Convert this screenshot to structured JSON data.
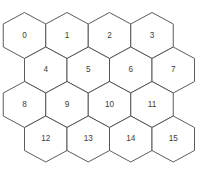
{
  "figure": {
    "name": "hexagonal-grid-diagram",
    "type": "hex-grid",
    "background_color": "#ffffff",
    "stroke_color": "#4a4a4a",
    "label_color": "#3b3b3b",
    "rows": 4,
    "columns": 4,
    "cell_count": 16,
    "orientation": "pointy-top",
    "hex_width": 42.5,
    "hex_height": 46.0,
    "row_step": 34.5,
    "row_offsets": [
      0,
      21.25,
      0,
      21.25
    ]
  },
  "cells": [
    {
      "label": "0",
      "row": 0,
      "col": 0,
      "cx": 24.5,
      "cy": 35.5
    },
    {
      "label": "1",
      "row": 0,
      "col": 1,
      "cx": 67.0,
      "cy": 35.5
    },
    {
      "label": "2",
      "row": 0,
      "col": 2,
      "cx": 109.5,
      "cy": 35.5
    },
    {
      "label": "3",
      "row": 0,
      "col": 3,
      "cx": 152.0,
      "cy": 35.5
    },
    {
      "label": "4",
      "row": 1,
      "col": 0,
      "cx": 45.75,
      "cy": 70.0
    },
    {
      "label": "5",
      "row": 1,
      "col": 1,
      "cx": 88.25,
      "cy": 70.0
    },
    {
      "label": "6",
      "row": 1,
      "col": 2,
      "cx": 130.75,
      "cy": 70.0
    },
    {
      "label": "7",
      "row": 1,
      "col": 3,
      "cx": 173.25,
      "cy": 70.0
    },
    {
      "label": "8",
      "row": 2,
      "col": 0,
      "cx": 24.5,
      "cy": 104.5
    },
    {
      "label": "9",
      "row": 2,
      "col": 1,
      "cx": 67.0,
      "cy": 104.5
    },
    {
      "label": "10",
      "row": 2,
      "col": 2,
      "cx": 109.5,
      "cy": 104.5
    },
    {
      "label": "11",
      "row": 2,
      "col": 3,
      "cx": 152.0,
      "cy": 104.5
    },
    {
      "label": "12",
      "row": 3,
      "col": 0,
      "cx": 45.75,
      "cy": 139.0
    },
    {
      "label": "13",
      "row": 3,
      "col": 1,
      "cx": 88.25,
      "cy": 139.0
    },
    {
      "label": "14",
      "row": 3,
      "col": 2,
      "cx": 130.75,
      "cy": 139.0
    },
    {
      "label": "15",
      "row": 3,
      "col": 3,
      "cx": 173.25,
      "cy": 139.0
    }
  ]
}
